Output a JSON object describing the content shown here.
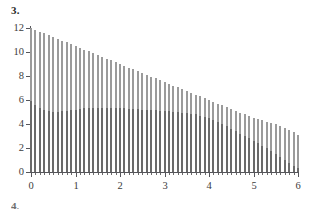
{
  "figure": {
    "item_number": "3.",
    "next_item_number": "4."
  },
  "colors": {
    "series_back": "#9b9b9b",
    "series_front": "#6a6a6a",
    "axis": "#55555a",
    "text": "#3c3c3c",
    "background": "#ffffff"
  },
  "chart_data": {
    "type": "bar",
    "title": "",
    "subtitle": "",
    "xlabel": "",
    "ylabel": "",
    "xlim": [
      0,
      6
    ],
    "ylim": [
      0,
      12
    ],
    "grid": false,
    "legend": "none",
    "bar_style": "overlaid",
    "x_tick_labels": [
      "0",
      "1",
      "2",
      "3",
      "4",
      "5",
      "6"
    ],
    "x_major_ticks": [
      0,
      1,
      2,
      3,
      4,
      5,
      6
    ],
    "x_minor_tick_step": 0.1,
    "y_tick_labels": [
      "0",
      "2",
      "4",
      "6",
      "8",
      "10",
      "12"
    ],
    "y_major_ticks": [
      0,
      2,
      4,
      6,
      8,
      10,
      12
    ],
    "x": [
      0,
      0.1,
      0.2,
      0.3,
      0.4,
      0.5,
      0.6,
      0.7,
      0.8,
      0.9,
      1,
      1.1,
      1.2,
      1.3,
      1.4,
      1.5,
      1.6,
      1.7,
      1.8,
      1.9,
      2,
      2.1,
      2.2,
      2.3,
      2.4,
      2.5,
      2.6,
      2.7,
      2.8,
      2.9,
      3,
      3.1,
      3.2,
      3.3,
      3.4,
      3.5,
      3.6,
      3.7,
      3.8,
      3.9,
      4,
      4.1,
      4.2,
      4.3,
      4.4,
      4.5,
      4.6,
      4.7,
      4.8,
      4.9,
      5,
      5.1,
      5.2,
      5.3,
      5.4,
      5.5,
      5.6,
      5.7,
      5.8,
      5.9,
      6
    ],
    "series": [
      {
        "name": "upper-envelope",
        "color": "#9b9b9b",
        "values": [
          12.0,
          11.85,
          11.7,
          11.55,
          11.4,
          11.25,
          11.1,
          10.95,
          10.8,
          10.65,
          10.5,
          10.35,
          10.2,
          10.05,
          9.9,
          9.75,
          9.6,
          9.45,
          9.3,
          9.15,
          9.0,
          8.85,
          8.7,
          8.55,
          8.4,
          8.25,
          8.1,
          7.95,
          7.8,
          7.65,
          7.5,
          7.35,
          7.2,
          7.05,
          6.9,
          6.75,
          6.6,
          6.45,
          6.3,
          6.15,
          6.0,
          5.85,
          5.7,
          5.55,
          5.4,
          5.25,
          5.1,
          4.95,
          4.8,
          4.65,
          4.5,
          4.4,
          4.3,
          4.2,
          4.1,
          4.0,
          3.85,
          3.7,
          3.5,
          3.3,
          3.1
        ]
      },
      {
        "name": "lower-series",
        "color": "#6a6a6a",
        "values": [
          5.9,
          5.55,
          5.3,
          5.15,
          5.05,
          5.0,
          5.0,
          5.05,
          5.1,
          5.15,
          5.2,
          5.25,
          5.3,
          5.3,
          5.35,
          5.35,
          5.35,
          5.35,
          5.3,
          5.3,
          5.3,
          5.3,
          5.25,
          5.25,
          5.25,
          5.2,
          5.2,
          5.15,
          5.15,
          5.1,
          5.1,
          5.05,
          5.0,
          5.0,
          4.95,
          4.9,
          4.85,
          4.8,
          4.7,
          4.6,
          4.5,
          4.35,
          4.2,
          4.0,
          3.8,
          3.6,
          3.4,
          3.2,
          3.0,
          2.8,
          2.6,
          2.4,
          2.2,
          2.0,
          1.75,
          1.5,
          1.25,
          1.0,
          0.75,
          0.5,
          0.3
        ]
      }
    ]
  }
}
